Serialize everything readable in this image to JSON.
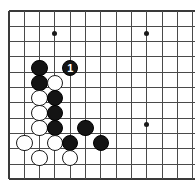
{
  "figure": {
    "kind": "go-board-diagram",
    "title": "",
    "board_size": 19,
    "view": {
      "columns_shown": 13,
      "rows_shown": 12,
      "corner": "top-left",
      "cropped_edges": [
        "right",
        "bottom"
      ]
    },
    "colors": {
      "background": "#ffffff",
      "grid_line": "#4a4a4a",
      "board_edge": "#3a3a3a",
      "black_stone": "#141414",
      "white_stone": "#ffffff",
      "stone_outline": "#1a1a1a",
      "black_label_text": "#ffffff"
    },
    "geometry": {
      "origin_x": 9,
      "origin_y": 11,
      "spacing": 15.3,
      "stone_diameter": 16.5,
      "hoshi_diameter": 5
    }
  },
  "grid": {
    "horizontal_line_rows": [
      0,
      1,
      2,
      3,
      4,
      5,
      6,
      7,
      8,
      9,
      10,
      11
    ],
    "vertical_line_cols": [
      0,
      1,
      2,
      3,
      4,
      5,
      6,
      7,
      8,
      9,
      10,
      11,
      12
    ],
    "edge_rows": [
      0,
      11
    ],
    "edge_cols": [
      0
    ]
  },
  "hoshi_points": [
    {
      "name": "hoshi-top-left",
      "col": 3,
      "row": 1.5
    },
    {
      "name": "hoshi-top-right",
      "col": 9,
      "row": 1.5
    },
    {
      "name": "hoshi-center-right",
      "col": 9,
      "row": 7.4
    }
  ],
  "stones": [
    {
      "id": "stone-1",
      "color": "black",
      "col": 2,
      "row": 3.73,
      "label": ""
    },
    {
      "id": "stone-2",
      "color": "black",
      "col": 4,
      "row": 3.73,
      "label": "1",
      "move_number": 1
    },
    {
      "id": "stone-3",
      "color": "black",
      "col": 2,
      "row": 4.71,
      "label": ""
    },
    {
      "id": "stone-4",
      "color": "white",
      "col": 3,
      "row": 4.71,
      "label": ""
    },
    {
      "id": "stone-5",
      "color": "white",
      "col": 2,
      "row": 5.69,
      "label": ""
    },
    {
      "id": "stone-6",
      "color": "black",
      "col": 3,
      "row": 5.69,
      "label": ""
    },
    {
      "id": "stone-7",
      "color": "white",
      "col": 2,
      "row": 6.67,
      "label": ""
    },
    {
      "id": "stone-8",
      "color": "black",
      "col": 3,
      "row": 6.67,
      "label": ""
    },
    {
      "id": "stone-9",
      "color": "white",
      "col": 2,
      "row": 7.65,
      "label": ""
    },
    {
      "id": "stone-10",
      "color": "black",
      "col": 3,
      "row": 7.65,
      "label": ""
    },
    {
      "id": "stone-11",
      "color": "black",
      "col": 5,
      "row": 7.65,
      "label": ""
    },
    {
      "id": "stone-12",
      "color": "white",
      "col": 1,
      "row": 8.63,
      "label": ""
    },
    {
      "id": "stone-13",
      "color": "white",
      "col": 3,
      "row": 8.63,
      "label": ""
    },
    {
      "id": "stone-14",
      "color": "black",
      "col": 4,
      "row": 8.63,
      "label": ""
    },
    {
      "id": "stone-15",
      "color": "black",
      "col": 6,
      "row": 8.63,
      "label": ""
    },
    {
      "id": "stone-16",
      "color": "white",
      "col": 2,
      "row": 9.61,
      "label": ""
    },
    {
      "id": "stone-17",
      "color": "white",
      "col": 4,
      "row": 9.61,
      "label": ""
    }
  ]
}
